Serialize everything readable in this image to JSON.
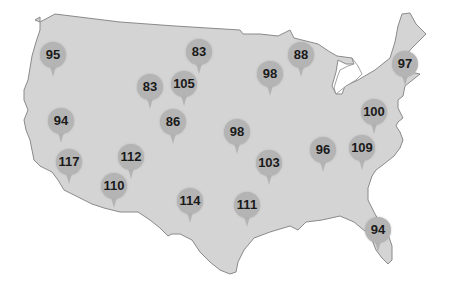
{
  "map": {
    "region": "Contiguous United States",
    "land_color": "#d4d4d4",
    "border_color": "#8a8a8a",
    "pin_color": "#b4b4b4",
    "label_color": "#1a1a1a",
    "pins": [
      {
        "value": "95",
        "x": 53,
        "y": 55
      },
      {
        "value": "83",
        "x": 199,
        "y": 52
      },
      {
        "value": "88",
        "x": 301,
        "y": 55
      },
      {
        "value": "98",
        "x": 270,
        "y": 74
      },
      {
        "value": "97",
        "x": 405,
        "y": 64
      },
      {
        "value": "83",
        "x": 150,
        "y": 87
      },
      {
        "value": "105",
        "x": 184,
        "y": 84
      },
      {
        "value": "94",
        "x": 61,
        "y": 121
      },
      {
        "value": "86",
        "x": 173,
        "y": 122
      },
      {
        "value": "100",
        "x": 374,
        "y": 112
      },
      {
        "value": "98",
        "x": 237,
        "y": 132
      },
      {
        "value": "117",
        "x": 69,
        "y": 162
      },
      {
        "value": "112",
        "x": 131,
        "y": 157
      },
      {
        "value": "96",
        "x": 323,
        "y": 150
      },
      {
        "value": "109",
        "x": 362,
        "y": 148
      },
      {
        "value": "103",
        "x": 269,
        "y": 163
      },
      {
        "value": "110",
        "x": 114,
        "y": 186
      },
      {
        "value": "114",
        "x": 190,
        "y": 201
      },
      {
        "value": "111",
        "x": 247,
        "y": 205
      },
      {
        "value": "94",
        "x": 378,
        "y": 230
      }
    ]
  }
}
